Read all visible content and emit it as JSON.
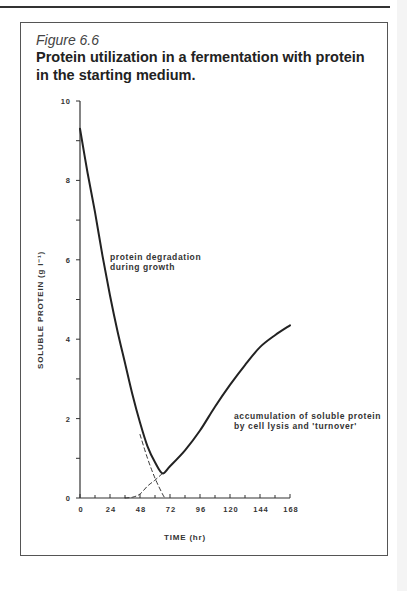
{
  "figure": {
    "label": "Figure 6.6",
    "title": "Protein utilization in a fermentation with protein in the starting medium."
  },
  "annotations": {
    "degradation_line1": "protein degradation",
    "degradation_line2": "during growth",
    "accumulation_line1": "accumulation of soluble protein",
    "accumulation_line2": "by cell lysis and 'turnover'"
  },
  "axes": {
    "xlabel": "TIME (hr)",
    "ylabel": "SOLUBLE PROTEIN (g l⁻¹)"
  },
  "chart_data": {
    "type": "line",
    "title": "Protein utilization in a fermentation with protein in the starting medium.",
    "xlabel": "TIME (hr)",
    "ylabel": "SOLUBLE PROTEIN (g l^-1)",
    "xlim": [
      0,
      168
    ],
    "ylim": [
      0,
      10
    ],
    "x_ticks": [
      0,
      24,
      48,
      72,
      96,
      120,
      144,
      168
    ],
    "y_ticks": [
      0,
      2,
      4,
      6,
      8,
      10
    ],
    "grid": false,
    "legend": null,
    "series": [
      {
        "name": "soluble protein (observed)",
        "style": "solid",
        "x": [
          0,
          6,
          12,
          18,
          24,
          30,
          36,
          42,
          48,
          54,
          60,
          66,
          72,
          84,
          96,
          108,
          120,
          132,
          144,
          156,
          168
        ],
        "y": [
          9.3,
          8.2,
          7.2,
          6.1,
          5.1,
          4.2,
          3.4,
          2.6,
          1.9,
          1.3,
          0.9,
          0.62,
          0.8,
          1.2,
          1.7,
          2.3,
          2.85,
          3.35,
          3.8,
          4.1,
          4.35
        ]
      },
      {
        "name": "protein degradation (extrapolated)",
        "style": "dashed",
        "x": [
          48,
          54,
          60,
          66,
          68
        ],
        "y": [
          1.6,
          1.0,
          0.5,
          0.1,
          0.0
        ]
      },
      {
        "name": "protein accumulation (extrapolated)",
        "style": "dashed",
        "x": [
          36,
          42,
          48,
          54,
          60,
          66
        ],
        "y": [
          0.0,
          0.02,
          0.1,
          0.3,
          0.45,
          0.62
        ]
      }
    ],
    "annotations": [
      {
        "text": "protein degradation during growth",
        "x": 24,
        "y": 6.8
      },
      {
        "text": "accumulation of soluble protein by cell lysis and 'turnover'",
        "x": 128,
        "y": 1.9
      }
    ]
  }
}
